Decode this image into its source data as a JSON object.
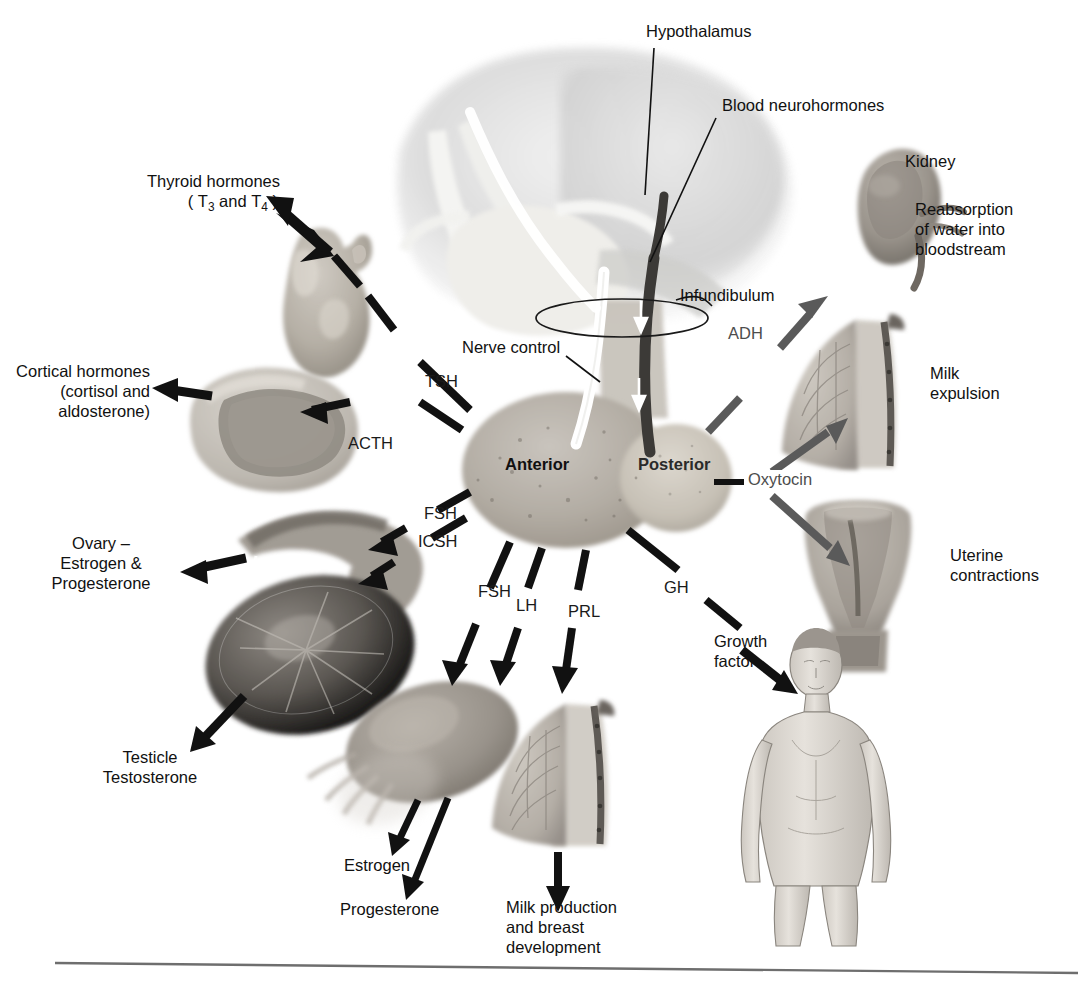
{
  "figure": {
    "background_color": "#ffffff",
    "label_color": "#111111",
    "grey_label_color": "#4d4d4d",
    "arrow_black": "#111111",
    "arrow_grey": "#5a5a5a",
    "rule_color": "#6e6e6e"
  },
  "central_structures": {
    "hypothalamus_label": "Hypothalamus",
    "blood_neurohormones_label": "Blood neurohormones",
    "infundibulum_label": "Infundibulum",
    "nerve_control_label": "Nerve control",
    "anterior_lobe_label": "Anterior",
    "posterior_lobe_label": "Posterior"
  },
  "anterior_hormones": [
    {
      "abbr": "TSH",
      "target_label": "Thyroid hormones",
      "target_label_line2": "( T3 and T4 )"
    },
    {
      "abbr": "ACTH",
      "target_label": "Cortical hormones",
      "target_label_line2": "(cortisol and",
      "target_label_line3": "aldosterone)"
    },
    {
      "abbr": "FSH",
      "target_label": "Ovary –",
      "target_label_line2": "Estrogen &",
      "target_label_line3": "Progesterone"
    },
    {
      "abbr": "ICSH",
      "target_label": "Testicle",
      "target_label_line2": "Testosterone"
    },
    {
      "abbr": "FSH",
      "target_label": "Estrogen"
    },
    {
      "abbr": "LH",
      "target_label": "Progesterone"
    },
    {
      "abbr": "PRL",
      "target_label": "Milk production",
      "target_label_line2": "and breast",
      "target_label_line3": "development"
    },
    {
      "abbr": "GH",
      "target_label": "Growth",
      "target_label_line2": "factor"
    }
  ],
  "posterior_hormones": [
    {
      "abbr": "ADH",
      "target_label": "Kidney",
      "effect_line1": "Reabsorption",
      "effect_line2": "of water into",
      "effect_line3": "bloodstream"
    },
    {
      "abbr": "Oxytocin",
      "effect_line1": "Milk",
      "effect_line2": "expulsion"
    },
    {
      "abbr": "Oxytocin",
      "effect_line1": "Uterine",
      "effect_line2": "contractions"
    }
  ],
  "labels": {
    "thyroid_l1": "Thyroid hormones",
    "thyroid_t3": "T",
    "thyroid_t3_sub": "3",
    "thyroid_and": "and",
    "thyroid_t4": "T",
    "thyroid_t4_sub": "4",
    "cortical_l1": "Cortical hormones",
    "cortical_l2": "(cortisol and",
    "cortical_l3": "aldosterone)",
    "ovary_l1": "Ovary –",
    "ovary_l2": "Estrogen &",
    "ovary_l3": "Progesterone",
    "testicle_l1": "Testicle",
    "testicle_l2": "Testosterone",
    "estrogen": "Estrogen",
    "progesterone": "Progesterone",
    "milk_prod_l1": "Milk production",
    "milk_prod_l2": "and breast",
    "milk_prod_l3": "development",
    "growth_l1": "Growth",
    "growth_l2": "factor",
    "kidney": "Kidney",
    "reabsorb_l1": "Reabsorption",
    "reabsorb_l2": "of water into",
    "reabsorb_l3": "bloodstream",
    "milk_exp_l1": "Milk",
    "milk_exp_l2": "expulsion",
    "uterine_l1": "Uterine",
    "uterine_l2": "contractions",
    "hypothalamus": "Hypothalamus",
    "blood_neurohormones": "Blood neurohormones",
    "infundibulum": "Infundibulum",
    "nerve_control": "Nerve control",
    "anterior": "Anterior",
    "posterior": "Posterior",
    "tsh": "TSH",
    "acth": "ACTH",
    "fsh_upper": "FSH",
    "icsh": "ICSH",
    "fsh_lower": "FSH",
    "lh": "LH",
    "prl": "PRL",
    "gh": "GH",
    "adh": "ADH",
    "oxytocin": "Oxytocin"
  }
}
